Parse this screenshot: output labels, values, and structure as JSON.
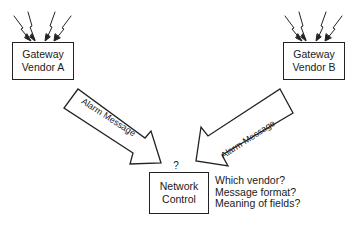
{
  "diagram": {
    "nodes": [
      {
        "id": "gateway_a",
        "line1": "Gateway",
        "line2": "Vendor A"
      },
      {
        "id": "gateway_b",
        "line1": "Gateway",
        "line2": "Vendor B"
      },
      {
        "id": "network_control",
        "line1": "Network",
        "line2": "Control",
        "marker": "?"
      }
    ],
    "edges": [
      {
        "from": "gateway_a",
        "to": "network_control",
        "label": "Alarm Message",
        "style": "block-arrow"
      },
      {
        "from": "gateway_b",
        "to": "network_control",
        "label": "Alarm Message",
        "style": "block-arrow"
      }
    ],
    "signal_icons": [
      {
        "attached_to": "gateway_a",
        "count": 4,
        "icon": "lightning-icon"
      },
      {
        "attached_to": "gateway_b",
        "count": 4,
        "icon": "lightning-icon"
      }
    ],
    "questions": [
      "Which vendor?",
      "Message format?",
      "Meaning of fields?"
    ],
    "colors": {
      "stroke": "#222222",
      "fill": "#ffffff",
      "text": "#1a1a1a"
    }
  }
}
